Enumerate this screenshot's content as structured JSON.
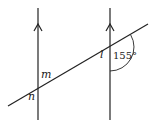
{
  "diagram": {
    "type": "parallel-lines-transversal",
    "parallel_lines": [
      {
        "id": "left",
        "x": 38,
        "y_top": 8,
        "y_bottom": 120,
        "arrow": "up"
      },
      {
        "id": "right",
        "x": 110,
        "y_top": 8,
        "y_bottom": 120,
        "arrow": "up"
      }
    ],
    "transversal": {
      "x1": 8,
      "y1": 106,
      "x2": 148,
      "y2": 24
    },
    "labels": {
      "m": "m",
      "n": "n",
      "l": "l",
      "angle": "155°"
    },
    "colors": {
      "stroke": "#222222",
      "background": "#ffffff"
    }
  }
}
